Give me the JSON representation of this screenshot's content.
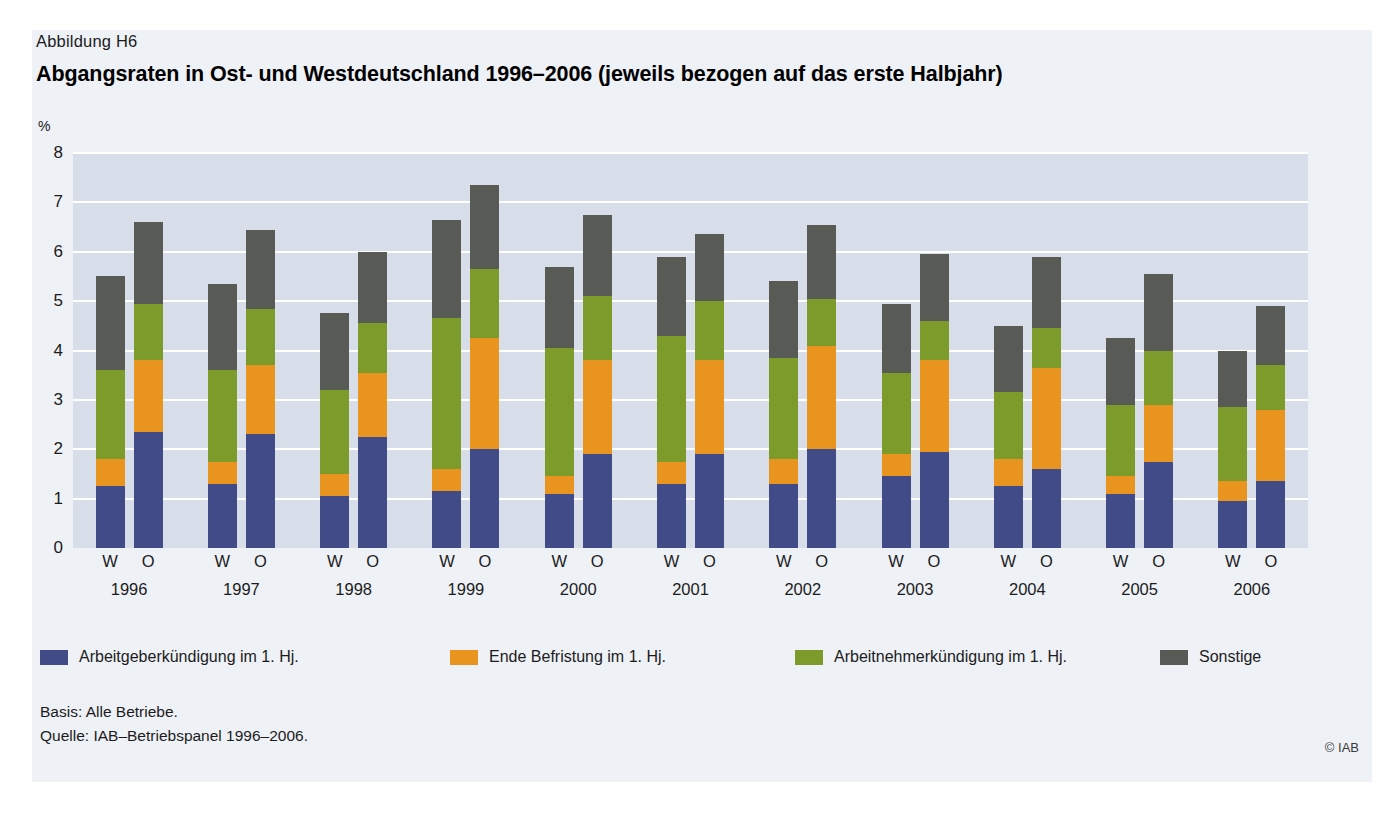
{
  "figure": {
    "number": "Abbildung H6",
    "title": "Abgangsraten in Ost- und Westdeutschland 1996–2006 (jeweils bezogen auf das erste Halbjahr)",
    "unit": "%",
    "basis": "Basis: Alle Betriebe.",
    "source": "Quelle: IAB–Betriebspanel 1996–2006.",
    "copyright": "© IAB"
  },
  "colors": {
    "card_background": "#eef1f6",
    "plot_background": "#d7dde9",
    "gridline": "#ffffff",
    "employer_termination": "#414b87",
    "end_of_contract": "#e8941e",
    "employee_termination": "#7d9b2a",
    "other": "#585a55"
  },
  "chart_data": {
    "type": "bar",
    "stacked": true,
    "title": "Abgangsraten in Ost- und Westdeutschland 1996–2006 (jeweils bezogen auf das erste Halbjahr)",
    "xlabel": "",
    "ylabel": "%",
    "ylim": [
      0,
      8
    ],
    "yticks": [
      0,
      1,
      2,
      3,
      4,
      5,
      6,
      7,
      8
    ],
    "ytick_labels": [
      "0",
      "1",
      "2",
      "3",
      "4",
      "5",
      "6",
      "7",
      "8"
    ],
    "grid": true,
    "legend_position": "bottom",
    "years": [
      "1996",
      "1997",
      "1998",
      "1999",
      "2000",
      "2001",
      "2002",
      "2003",
      "2004",
      "2005",
      "2006"
    ],
    "region_labels": [
      "W",
      "O"
    ],
    "region_names": {
      "W": "Westdeutschland",
      "O": "Ostdeutschland"
    },
    "series": [
      {
        "name": "Arbeitgeberkündigung im 1. Hj.",
        "color": "#414b87",
        "values_west": [
          1.25,
          1.3,
          1.05,
          1.15,
          1.1,
          1.3,
          1.3,
          1.45,
          1.25,
          1.1,
          0.95
        ],
        "values_ost": [
          2.35,
          2.3,
          2.25,
          2.0,
          1.9,
          1.9,
          2.0,
          1.95,
          1.6,
          1.75,
          1.35
        ]
      },
      {
        "name": "Ende Befristung im 1. Hj.",
        "color": "#e8941e",
        "values_west": [
          0.55,
          0.45,
          0.45,
          0.45,
          0.35,
          0.45,
          0.5,
          0.45,
          0.55,
          0.35,
          0.4
        ],
        "values_ost": [
          1.45,
          1.4,
          1.3,
          2.25,
          1.9,
          1.9,
          2.1,
          1.85,
          2.05,
          1.15,
          1.45
        ]
      },
      {
        "name": "Arbeitnehmerkündigung im 1. Hj.",
        "color": "#7d9b2a",
        "values_west": [
          1.8,
          1.85,
          1.7,
          3.05,
          2.6,
          2.55,
          2.05,
          1.65,
          1.35,
          1.45,
          1.5
        ],
        "values_ost": [
          1.15,
          1.15,
          1.0,
          1.4,
          1.3,
          1.2,
          0.95,
          0.8,
          0.8,
          1.1,
          0.9
        ]
      },
      {
        "name": "Sonstige",
        "color": "#585a55",
        "values_west": [
          1.9,
          1.75,
          1.55,
          2.0,
          1.65,
          1.6,
          1.55,
          1.4,
          1.35,
          1.35,
          1.15
        ],
        "values_ost": [
          1.65,
          1.6,
          1.45,
          1.7,
          1.65,
          1.35,
          1.5,
          1.35,
          1.45,
          1.55,
          1.2
        ]
      }
    ],
    "totals_west": [
      5.5,
      5.35,
      4.75,
      6.65,
      5.7,
      5.9,
      5.4,
      4.95,
      4.5,
      4.25,
      4.0
    ],
    "totals_ost": [
      6.6,
      6.45,
      6.0,
      7.35,
      6.75,
      6.35,
      6.55,
      5.95,
      5.9,
      5.55,
      4.9
    ]
  },
  "legend": [
    {
      "label": "Arbeitgeberkündigung im 1. Hj.",
      "color": "#414b87"
    },
    {
      "label": "Ende Befristung im 1. Hj.",
      "color": "#e8941e"
    },
    {
      "label": "Arbeitnehmerkündigung im 1. Hj.",
      "color": "#7d9b2a"
    },
    {
      "label": "Sonstige",
      "color": "#585a55"
    }
  ]
}
